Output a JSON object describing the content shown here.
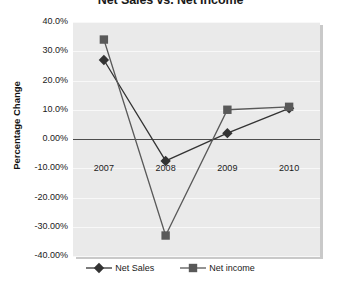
{
  "chart_data": {
    "type": "line",
    "title": "Net Sales vs. Net Income",
    "xlabel": "",
    "ylabel": "Percentage Change",
    "categories": [
      "2007",
      "2008",
      "2009",
      "2010"
    ],
    "series": [
      {
        "name": "Net Sales",
        "marker": "diamond",
        "color": "#333333",
        "values": [
          0.27,
          -0.075,
          0.02,
          0.105
        ]
      },
      {
        "name": "Net income",
        "marker": "square",
        "color": "#595959",
        "values": [
          0.34,
          -0.33,
          0.1,
          0.11
        ]
      }
    ],
    "ylim": [
      -0.4,
      0.4
    ],
    "ytick_labels": [
      "40.0%",
      "30.0%",
      "20.0%",
      "10.0%",
      "0.00%",
      "-10.00%",
      "-20.00%",
      "-30.00%",
      "-40.00%"
    ],
    "ytick_values": [
      0.4,
      0.3,
      0.2,
      0.1,
      0.0,
      -0.1,
      -0.2,
      -0.3,
      -0.4
    ],
    "grid": true,
    "legend_position": "bottom",
    "plot_background": "#eaeaea",
    "gridline_color": "#f8f8f8",
    "zero_axis_color": "#4d4d4d"
  }
}
